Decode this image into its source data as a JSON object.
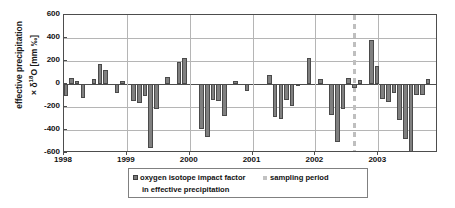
{
  "chart_data": {
    "type": "bar",
    "title": "",
    "xlabel": "",
    "ylabel_line1": "effective precipitation",
    "ylabel_line2": "× δ",
    "ylabel_sup": "18",
    "ylabel_line2b": "O [mm ‰]",
    "ylim": [
      -600,
      600
    ],
    "yticks": [
      600,
      400,
      200,
      0,
      -200,
      -400,
      -600
    ],
    "ytick_labels": [
      "600",
      "400",
      "200",
      "0",
      "-200",
      "-400",
      "-600"
    ],
    "xlim": [
      1998.0,
      2003.95
    ],
    "xticks": [
      1998,
      1999,
      2000,
      2001,
      2002,
      2003
    ],
    "xtick_labels": [
      "1998",
      "1999",
      "2000",
      "2001",
      "2002",
      "2003"
    ],
    "grid": "horizontal-and-vertical",
    "legend_position": "below-axes",
    "series": [
      {
        "name": "oxygen isotope impact factor in effective precipitation",
        "color": "#808080",
        "x": [
          1998.03,
          1998.12,
          1998.21,
          1998.3,
          1998.39,
          1998.48,
          1998.57,
          1998.66,
          1998.75,
          1998.84,
          1998.93,
          1999.02,
          1999.11,
          1999.2,
          1999.29,
          1999.38,
          1999.47,
          1999.56,
          1999.65,
          1999.74,
          1999.83,
          1999.92,
          2000.01,
          2000.1,
          2000.19,
          2000.28,
          2000.37,
          2000.46,
          2000.55,
          2000.64,
          2000.73,
          2000.82,
          2000.91,
          2001.0,
          2001.09,
          2001.18,
          2001.27,
          2001.36,
          2001.45,
          2001.54,
          2001.63,
          2001.72,
          2001.81,
          2001.9,
          2001.99,
          2002.08,
          2002.17,
          2002.26,
          2002.35,
          2002.44,
          2002.53,
          2002.62,
          2002.71,
          2002.8,
          2002.89,
          2002.98,
          2003.07,
          2003.16,
          2003.25,
          2003.34,
          2003.43,
          2003.52,
          2003.61,
          2003.7,
          2003.79
        ],
        "values": [
          -105,
          55,
          25,
          -120,
          0,
          45,
          175,
          120,
          0,
          -80,
          30,
          0,
          -150,
          -165,
          -100,
          -555,
          -215,
          0,
          60,
          0,
          190,
          230,
          0,
          0,
          -390,
          -465,
          -140,
          -145,
          -275,
          0,
          30,
          0,
          -65,
          0,
          0,
          0,
          80,
          -290,
          -300,
          -140,
          -190,
          -20,
          0,
          225,
          0,
          45,
          0,
          -270,
          -505,
          -215,
          50,
          -35,
          35,
          0,
          385,
          155,
          -130,
          -155,
          -80,
          -310,
          -480,
          -590,
          -95,
          -95,
          45
        ],
        "zero_positions": [
          1998.39,
          1998.93,
          1999.56,
          1999.74,
          2000.01,
          2000.1,
          2000.64,
          2000.82,
          2001.0,
          2001.09,
          2001.18,
          2001.63,
          2001.81,
          2001.99,
          2002.17,
          2002.44,
          2002.8
        ]
      }
    ],
    "annotations": [
      {
        "name": "sampling period",
        "type": "vertical-dashed-line",
        "x": 2002.62,
        "color": "#bfbfbf"
      }
    ],
    "legend": [
      {
        "label_line1": "oxygen isotope impact factor",
        "label_line2": "in effective precipitation",
        "marker": "filled-square-dark-gray"
      },
      {
        "label_line1": "sampling period",
        "label_line2": "",
        "marker": "small-square-light-gray"
      }
    ]
  }
}
